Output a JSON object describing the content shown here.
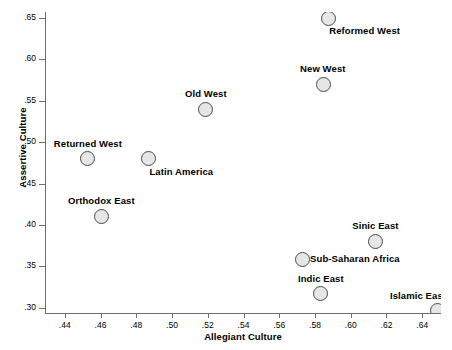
{
  "chart_data": {
    "type": "scatter",
    "title": "",
    "xlabel": "Allegiant Culture",
    "ylabel": "Assertive Culture",
    "xlim": [
      0.4295,
      0.6505
    ],
    "ylim": [
      0.2936,
      0.6573
    ],
    "grid": false,
    "legend": "none",
    "xticks": [
      ".44",
      ".46",
      ".48",
      ".50",
      ".52",
      ".54",
      ".56",
      ".58",
      ".60",
      ".62",
      ".64"
    ],
    "xtick_values": [
      0.44,
      0.46,
      0.48,
      0.5,
      0.52,
      0.54,
      0.56,
      0.58,
      0.6,
      0.62,
      0.64
    ],
    "yticks": [
      ".65",
      ".60",
      ".55",
      ".50",
      ".45",
      ".40",
      ".35",
      ".30"
    ],
    "ytick_values": [
      0.65,
      0.6,
      0.55,
      0.5,
      0.45,
      0.4,
      0.35,
      0.3
    ],
    "marker": {
      "shape": "circle",
      "fill_color": "#e6e6e6",
      "edge_color": "#4a4a4a",
      "size_px": 15
    },
    "points": [
      {
        "label": "Reformed West",
        "x": 0.5874,
        "y": 0.65,
        "label_pos": "below-right"
      },
      {
        "label": "New West",
        "x": 0.5845,
        "y": 0.57,
        "label_pos": "above"
      },
      {
        "label": "Old West",
        "x": 0.519,
        "y": 0.54,
        "label_pos": "above"
      },
      {
        "label": "Returned West",
        "x": 0.4529,
        "y": 0.48,
        "label_pos": "above"
      },
      {
        "label": "Latin America",
        "x": 0.4868,
        "y": 0.48,
        "label_pos": "below-right"
      },
      {
        "label": "Orthodox East",
        "x": 0.4605,
        "y": 0.4105,
        "label_pos": "above"
      },
      {
        "label": "Sinic East",
        "x": 0.6137,
        "y": 0.3805,
        "label_pos": "above"
      },
      {
        "label": "Sub-Saharan Africa",
        "x": 0.5728,
        "y": 0.3585,
        "label_pos": "right"
      },
      {
        "label": "Indic East",
        "x": 0.5833,
        "y": 0.317,
        "label_pos": "above"
      },
      {
        "label": "Islamic East",
        "x": 0.6488,
        "y": 0.2965,
        "label_pos": "above-left"
      }
    ]
  },
  "axis_colors": {
    "axis_line": "#6e6e6e",
    "text": "#000000",
    "background": "#ffffff"
  }
}
